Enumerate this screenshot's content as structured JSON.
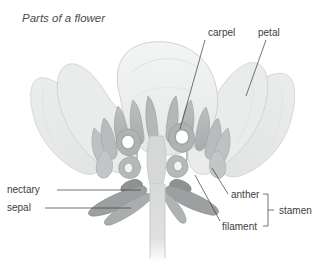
{
  "figure": {
    "title": "Parts of a flower"
  },
  "labels": {
    "carpel": "carpel",
    "petal": "petal",
    "nectary": "nectary",
    "sepal": "sepal",
    "anther": "anther",
    "filament": "filament",
    "stamen": "stamen"
  },
  "colors": {
    "background": "#ffffff",
    "petal_fill": "#e9eaea",
    "petal_fill_light": "#eff0f0",
    "petal_outline": "#cfd2d2",
    "stamen_fill": "#b7baba",
    "stamen_outline": "#9da0a0",
    "carpel_ring": "#a8abab",
    "carpel_center": "#ffffff",
    "sepal_fill": "#9c9f9f",
    "stem_fill": "#dcdede",
    "stem_outline": "#c3c6c6",
    "leader_line": "#3a3a3a",
    "label_text": "#3d3d3d",
    "title_text": "#4b4b4b"
  },
  "annotations": [
    {
      "name": "carpel",
      "text_x": 208,
      "text_y": 36,
      "anchor": "start",
      "leader": "diagonal",
      "from_x": 205,
      "from_y": 40,
      "to_x": 180,
      "to_y": 129
    },
    {
      "name": "petal",
      "text_x": 258,
      "text_y": 36,
      "anchor": "start",
      "leader": "diagonal",
      "from_x": 266,
      "from_y": 40,
      "to_x": 246,
      "to_y": 96
    },
    {
      "name": "nectary",
      "text_x": 7,
      "text_y": 193,
      "anchor": "start",
      "leader": "horizontal",
      "from_x": 57,
      "from_y": 190,
      "to_x": 141,
      "to_y": 190
    },
    {
      "name": "sepal",
      "text_x": 7,
      "text_y": 211,
      "anchor": "start",
      "leader": "horizontal",
      "from_x": 45,
      "from_y": 208,
      "to_x": 131,
      "to_y": 208
    },
    {
      "name": "anther",
      "text_x": 231,
      "text_y": 200,
      "anchor": "start",
      "leader": "diagonal",
      "from_x": 228,
      "from_y": 194,
      "to_x": 212,
      "to_y": 168
    },
    {
      "name": "filament",
      "text_x": 222,
      "text_y": 228,
      "anchor": "start",
      "leader": "diagonal",
      "from_x": 220,
      "from_y": 221,
      "to_x": 195,
      "to_y": 175
    },
    {
      "name": "stamen",
      "text_x": 279,
      "text_y": 214,
      "anchor": "start",
      "leader": "bracket",
      "from_x": 268,
      "from_y": 194,
      "to_x": 268,
      "to_y": 226
    }
  ],
  "parts": [
    {
      "name": "petal",
      "count": 5,
      "description": "large rounded outer segments"
    },
    {
      "name": "stamen",
      "count": 14,
      "description": "anther on filament"
    },
    {
      "name": "carpel",
      "count": 4,
      "description": "ring-shaped ovaries at centre"
    },
    {
      "name": "nectary",
      "count": 2,
      "description": "small gland at base"
    },
    {
      "name": "sepal",
      "count": 3,
      "description": "pointed leaf-like base"
    },
    {
      "name": "stem",
      "count": 1,
      "description": "vertical stalk"
    }
  ]
}
